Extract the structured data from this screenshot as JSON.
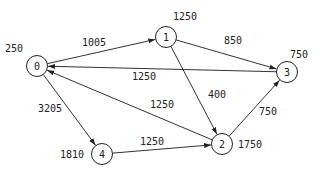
{
  "graph": {
    "type": "directed-weighted-graph",
    "nodes": [
      {
        "id": "0",
        "label": "0",
        "value": "250",
        "x": 37,
        "y": 66,
        "vx": 5,
        "vy": 52
      },
      {
        "id": "1",
        "label": "1",
        "value": "1250",
        "x": 166,
        "y": 37,
        "vx": 173,
        "vy": 20
      },
      {
        "id": "2",
        "label": "2",
        "value": "1750",
        "x": 222,
        "y": 144,
        "vx": 238,
        "vy": 148
      },
      {
        "id": "3",
        "label": "3",
        "value": "750",
        "x": 287,
        "y": 72,
        "vx": 290,
        "vy": 58
      },
      {
        "id": "4",
        "label": "4",
        "value": "1810",
        "x": 102,
        "y": 154,
        "vx": 60,
        "vy": 158
      }
    ],
    "edges": [
      {
        "from": "0",
        "to": "1",
        "weight": "1005",
        "lx": 82,
        "ly": 46
      },
      {
        "from": "1",
        "to": "3",
        "weight": "850",
        "lx": 224,
        "ly": 44
      },
      {
        "from": "3",
        "to": "0",
        "weight": "1250",
        "lx": 132,
        "ly": 80
      },
      {
        "from": "1",
        "to": "2",
        "weight": "400",
        "lx": 208,
        "ly": 98
      },
      {
        "from": "2",
        "to": "0",
        "weight": "1250",
        "lx": 150,
        "ly": 108
      },
      {
        "from": "0",
        "to": "4",
        "weight": "3205",
        "lx": 38,
        "ly": 112
      },
      {
        "from": "4",
        "to": "2",
        "weight": "1250",
        "lx": 140,
        "ly": 145
      },
      {
        "from": "2",
        "to": "3",
        "weight": "750",
        "lx": 259,
        "ly": 115
      }
    ]
  }
}
